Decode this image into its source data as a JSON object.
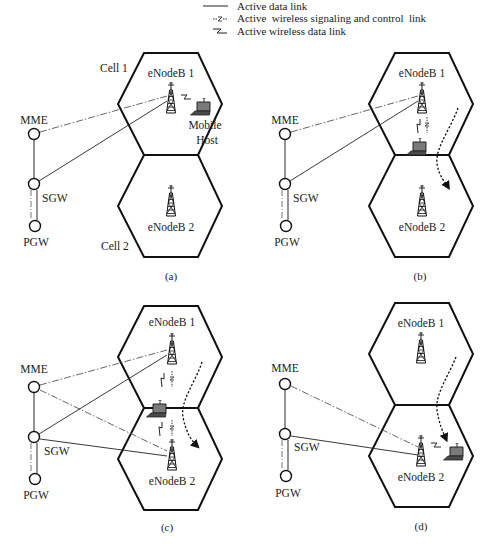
{
  "legend": {
    "items": [
      {
        "label": "Active data link",
        "style": "solid-line"
      },
      {
        "label": "Active  wireless signaling and control  link",
        "style": "dashed-zigzag"
      },
      {
        "label": "Active wireless data link",
        "style": "zigzag"
      }
    ]
  },
  "panels": {
    "a": {
      "caption": "(a)",
      "mme": "MME",
      "sgw": "SGW",
      "pgw": "PGW",
      "enb1": "eNodeB 1",
      "enb2": "eNodeB 2",
      "cell1": "Cell 1",
      "cell2": "Cell 2",
      "host_line1": "Mobile",
      "host_line2": "Host"
    },
    "b": {
      "caption": "(b)",
      "mme": "MME",
      "sgw": "SGW",
      "pgw": "PGW",
      "enb1": "eNodeB 1",
      "enb2": "eNodeB 2"
    },
    "c": {
      "caption": "(c)",
      "mme": "MME",
      "sgw": "SGW",
      "pgw": "PGW",
      "enb1": "eNodeB 1",
      "enb2": "eNodeB 2"
    },
    "d": {
      "caption": "(d)",
      "mme": "MME",
      "sgw": "SGW",
      "pgw": "PGW",
      "enb1": "eNodeB 1",
      "enb2": "eNodeB 2"
    }
  },
  "colors": {
    "lines": "#111111",
    "core_links": "#666666",
    "laptop_screen": "#7a7a7a",
    "background": "#ffffff"
  }
}
